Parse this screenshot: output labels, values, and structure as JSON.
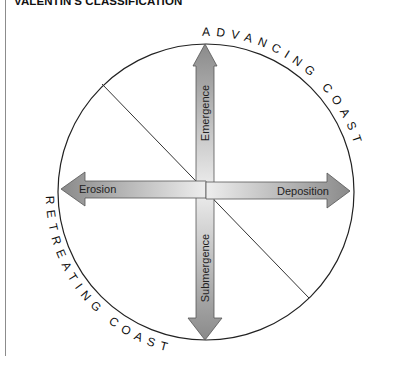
{
  "title": "VALENTIN'S CLASSIFICATION",
  "diagram": {
    "arc_labels": {
      "top_right": "ADVANCING COAST",
      "bottom_left": "RETREATING COAST"
    },
    "arrows": {
      "up": "Emergence",
      "down": "Submergence",
      "left": "Erosion",
      "right": "Deposition"
    },
    "colors": {
      "arrow_dark": "#8a8a8a",
      "arrow_light": "#ececec",
      "outline": "#222222"
    }
  }
}
